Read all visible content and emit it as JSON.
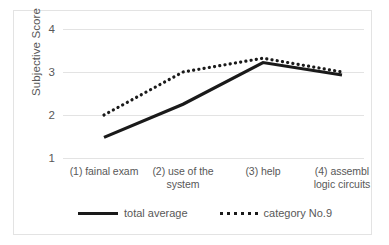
{
  "chart_data": {
    "type": "line",
    "title": "",
    "xlabel": "",
    "ylabel": "Subjective Score",
    "categories": [
      "(1) fainal exam",
      "(2) use of the system",
      "(3) help",
      "(4) assembl logic circuits"
    ],
    "category_lines": [
      [
        "(1) fainal exam"
      ],
      [
        "(2) use of the",
        "system"
      ],
      [
        "(3) help"
      ],
      [
        "(4) assembl",
        "logic circuits"
      ]
    ],
    "series": [
      {
        "name": "total average",
        "style": "solid",
        "color": "#1a1a1a",
        "values": [
          1.48,
          2.25,
          3.22,
          2.93
        ]
      },
      {
        "name": "category No.9",
        "style": "dotted",
        "color": "#1a1a1a",
        "values": [
          2.0,
          3.0,
          3.32,
          3.0
        ]
      }
    ],
    "ylim": [
      1,
      4
    ],
    "yticks": [
      1,
      2,
      3,
      4
    ],
    "ytick_labels": [
      "1",
      "2",
      "3",
      "4"
    ],
    "grid": true,
    "grid_color": "#e3e3e3",
    "legend_position": "bottom",
    "axis_text_color": "#585858",
    "frame_color": "#e3e3e3",
    "background": "#ffffff"
  },
  "legend": {
    "entries": [
      {
        "label": "total average",
        "style": "solid"
      },
      {
        "label": "category No.9",
        "style": "dotted"
      }
    ]
  }
}
